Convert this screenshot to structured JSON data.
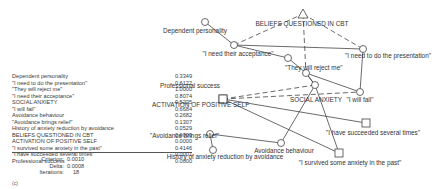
{
  "table": {
    "rows": [
      {
        "label": "Dependent personality",
        "value": "0.3349"
      },
      {
        "label": "\"I need to do the presentation\"",
        "value": "0.6122"
      },
      {
        "label": "\"They will reject me\"",
        "value": "1.0000"
      },
      {
        "label": "\"I need their acceptance\"",
        "value": "0.8074"
      },
      {
        "label": "SOCIAL ANXIETY",
        "value": "0.5235"
      },
      {
        "label": "\"I will fail\"",
        "value": "0.6684"
      },
      {
        "label": "Avoidance behaviour",
        "value": "0.2682"
      },
      {
        "label": "\"Avoidance brings relief\"",
        "value": "0.1307"
      },
      {
        "label": "History of anxiety reduction by avoidance",
        "value": "0.0529"
      },
      {
        "label": "BELIEFS QUESTIONED IN CBT",
        "value": "0.0000"
      },
      {
        "label": "ACTIVATION OF POSITIVE SELF",
        "value": "0.0000"
      },
      {
        "label": "\"I survived some anxiety in the past\"",
        "value": "0.4146"
      },
      {
        "label": "\"I have succeeded several times\"",
        "value": "0.0001"
      },
      {
        "label": "Professional success",
        "value": "0.0000"
      }
    ]
  },
  "stats": {
    "criterion_label": "Criterion:",
    "criterion": "0.0010",
    "delta_label": "Delta:",
    "delta": "0.0008",
    "iterations_label": "Iterations:",
    "iterations": "18"
  },
  "caption": "(c)",
  "network": {
    "nodes": [
      {
        "id": "dep",
        "label": "Dependent personality",
        "shape": "circle"
      },
      {
        "id": "dep_src",
        "label": "",
        "shape": "circle"
      },
      {
        "id": "acc",
        "label": "\"I need their acceptance\"",
        "shape": "circle"
      },
      {
        "id": "rej",
        "label": "\"They will reject me\"",
        "shape": "circle"
      },
      {
        "id": "pres",
        "label": "\"I need to do the presentation\"",
        "shape": "circle"
      },
      {
        "id": "cbt",
        "label": "BELIEFS QUESTIONED IN CBT",
        "shape": "triangle"
      },
      {
        "id": "soc",
        "label": "SOCIAL ANXIETY",
        "shape": "circle"
      },
      {
        "id": "fail",
        "label": "\"I will fail\"",
        "shape": "circle"
      },
      {
        "id": "prof",
        "label": "Professional success",
        "shape": "square"
      },
      {
        "id": "pos",
        "label": "ACTIVATION OF POSITIVE SELF",
        "shape": "square"
      },
      {
        "id": "relief",
        "label": "\"Avoidance brings relief\"",
        "shape": "circle"
      },
      {
        "id": "hist",
        "label": "History of anxiety reduction by avoidance",
        "shape": "circle"
      },
      {
        "id": "avb",
        "label": "Avoidance behaviour",
        "shape": "circle"
      },
      {
        "id": "succ",
        "label": "\"I have succeeded several times\"",
        "shape": "square"
      },
      {
        "id": "surv",
        "label": "\"I survived some anxiety in the past\"",
        "shape": "square"
      }
    ]
  }
}
